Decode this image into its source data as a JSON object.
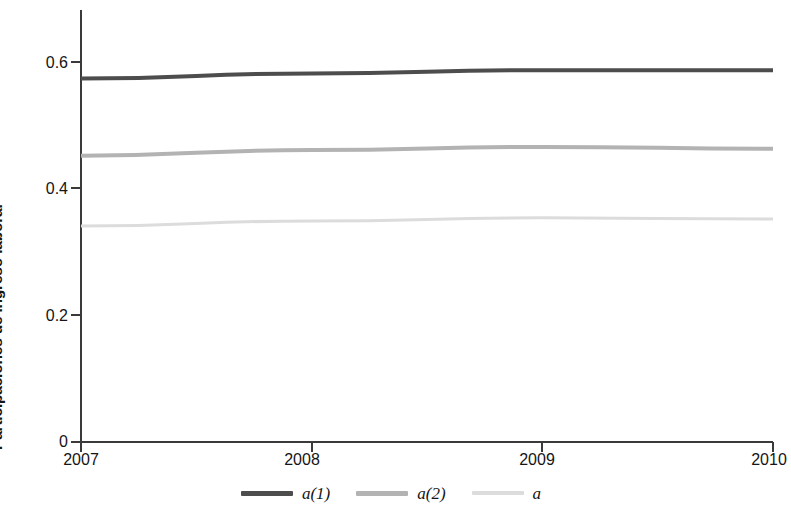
{
  "chart_data": {
    "type": "line",
    "title": "",
    "xlabel": "",
    "ylabel": "Participaciones de ingreso laboral",
    "x": [
      2007,
      2008,
      2009,
      2010
    ],
    "xlim": [
      2007,
      2010
    ],
    "ylim": [
      0,
      0.66
    ],
    "xticks": [
      2007,
      2008,
      2009,
      2010
    ],
    "xtick_labels": [
      "2007",
      "2008",
      "2009",
      "2010"
    ],
    "yticks": [
      0,
      0.2,
      0.4,
      0.6
    ],
    "ytick_labels": [
      "0",
      "0.2",
      "0.4",
      "0.6"
    ],
    "grid": false,
    "legend_position": "bottom",
    "series": [
      {
        "name": "a(1)",
        "color": "#4d4d4d",
        "width": 4,
        "values": [
          0.574,
          0.582,
          0.587,
          0.587
        ]
      },
      {
        "name": "a(2)",
        "color": "#b3b3b3",
        "width": 4,
        "values": [
          0.452,
          0.461,
          0.466,
          0.463
        ]
      },
      {
        "name": "a",
        "color": "#dcdcdc",
        "width": 3,
        "values": [
          0.341,
          0.349,
          0.354,
          0.352
        ]
      }
    ]
  },
  "axes": {
    "axis_color": "#3a3a3a",
    "y_label": "Participaciones de ingreso laboral"
  },
  "legend": {
    "items": [
      {
        "label": "a(1)",
        "color": "#4d4d4d"
      },
      {
        "label": "a(2)",
        "color": "#b3b3b3"
      },
      {
        "label": "a",
        "color": "#dcdcdc"
      }
    ]
  }
}
